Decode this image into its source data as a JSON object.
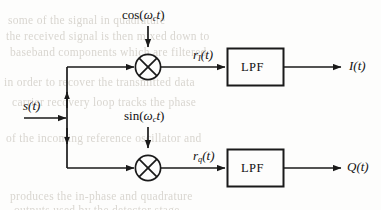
{
  "figure": {
    "type": "block-diagram",
    "name": "IQ quadrature demodulator block diagram",
    "stroke_color": "#1a1a1a",
    "background_color": "#fdfdfc",
    "ghost_text_color": "#d9d6d0"
  },
  "signals": {
    "input": "s(t)",
    "carrier_cos": "cos(ωct)",
    "carrier_cos_parts": {
      "fn": "cos(",
      "omega": "ω",
      "sub": "c",
      "t": "t",
      "close": ")"
    },
    "carrier_sin": "sin(ωct)",
    "carrier_sin_parts": {
      "fn": "sin(",
      "omega": "ω",
      "sub": "c",
      "t": "t",
      "close": ")"
    },
    "mixer_out_i": "rI(t)",
    "mixer_out_i_parts": {
      "r": "r",
      "sub": "I",
      "t": "(t)"
    },
    "mixer_out_q": "rQ(t)",
    "mixer_out_q_parts": {
      "r": "r",
      "sub": "q",
      "t": "(t)"
    },
    "output_i": "I(t)",
    "output_q": "Q(t)"
  },
  "blocks": {
    "lpf_upper_label": "LPF",
    "lpf_lower_label": "LPF",
    "mixer_upper_symbol": "⊗",
    "mixer_lower_symbol": "⊗"
  },
  "ghost_lines": [
    {
      "text": "some of the signal in quadrature",
      "x": 8,
      "y": 14
    },
    {
      "text": "the received signal is then mixed down to",
      "x": 6,
      "y": 30
    },
    {
      "text": "baseband components which are filtered",
      "x": 10,
      "y": 46
    },
    {
      "text": "in order to recover the transmitted data",
      "x": 4,
      "y": 76
    },
    {
      "text": "carrier recovery loop tracks the phase",
      "x": 12,
      "y": 96
    },
    {
      "text": "of the incoming reference oscillator and",
      "x": 6,
      "y": 132
    },
    {
      "text": "produces the in-phase and quadrature",
      "x": 10,
      "y": 190
    },
    {
      "text": "outputs used by the detector stage",
      "x": 14,
      "y": 204
    }
  ]
}
